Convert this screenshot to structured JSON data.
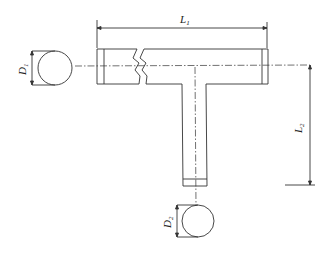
{
  "diagram": {
    "type": "technical drawing",
    "colors": {
      "stroke": "#333333",
      "background": "#ffffff"
    },
    "labels": {
      "L1": {
        "main": "L",
        "sub": "1"
      },
      "L2": {
        "main": "L",
        "sub": "2"
      },
      "D1": {
        "main": "D",
        "sub": "1"
      },
      "D2": {
        "main": "D",
        "sub": "2"
      }
    },
    "components": [
      "main-pipe (horizontal, with break symbol)",
      "branch-pipe (vertical)",
      "end-view circle D1",
      "end-view circle D2",
      "dimension L1 (main pipe length)",
      "dimension L2 (branch length from centerline)",
      "dimension D1 (main pipe diameter)",
      "dimension D2 (branch pipe diameter)"
    ]
  }
}
